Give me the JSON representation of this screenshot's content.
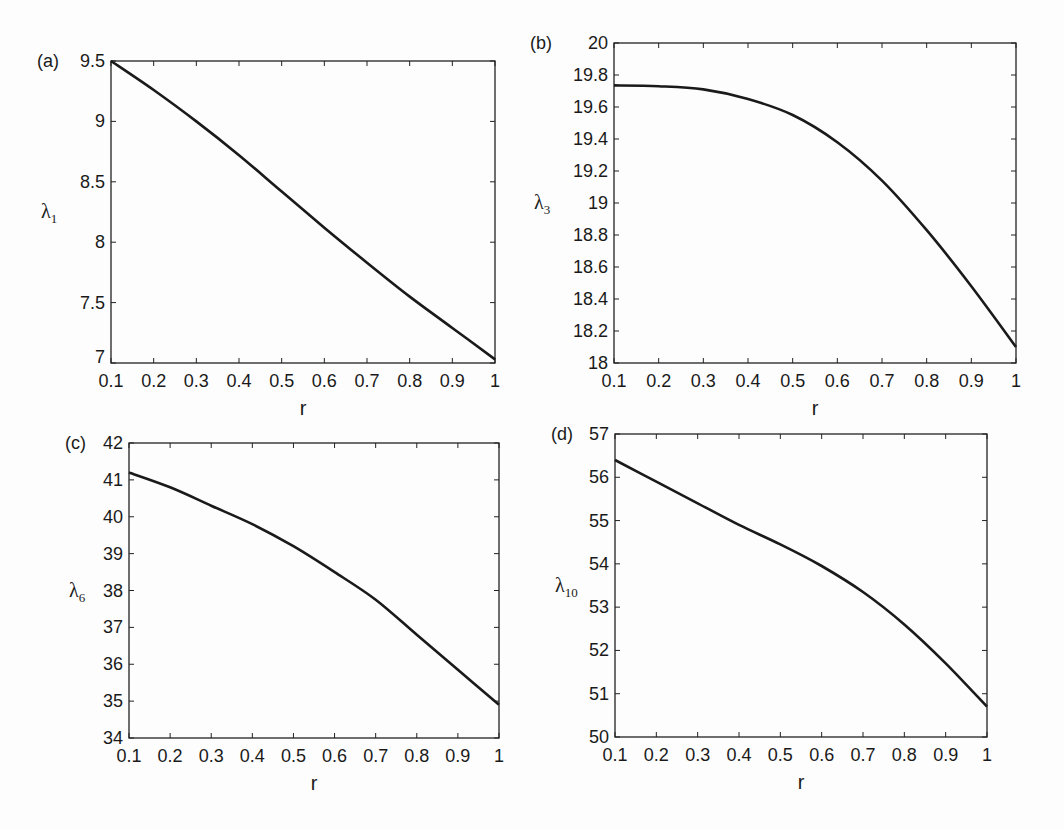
{
  "chart_data": [
    {
      "type": "line",
      "panel_label": "(a)",
      "title": "",
      "xlabel": "r",
      "ylabel": "λ",
      "ylabel_sub": "1",
      "xlim": [
        0.1,
        1
      ],
      "ylim": [
        7,
        9.5
      ],
      "xticks": [
        "0.1",
        "0.2",
        "0.3",
        "0.4",
        "0.5",
        "0.6",
        "0.7",
        "0.8",
        "0.9",
        "1"
      ],
      "yticks": [
        "7",
        "7.5",
        "8",
        "8.5",
        "9",
        "9.5"
      ],
      "grid": false,
      "x": [
        0.1,
        0.2,
        0.3,
        0.4,
        0.5,
        0.6,
        0.7,
        0.8,
        0.9,
        1.0
      ],
      "series": [
        {
          "name": "λ1",
          "values": [
            9.5,
            9.26,
            9.0,
            8.72,
            8.42,
            8.12,
            7.83,
            7.55,
            7.29,
            7.03
          ]
        }
      ],
      "box": {
        "left": 111,
        "top": 61,
        "right": 495,
        "bottom": 363
      }
    },
    {
      "type": "line",
      "panel_label": "(b)",
      "title": "",
      "xlabel": "r",
      "ylabel": "λ",
      "ylabel_sub": "3",
      "xlim": [
        0.1,
        1
      ],
      "ylim": [
        18,
        20
      ],
      "xticks": [
        "0.1",
        "0.2",
        "0.3",
        "0.4",
        "0.5",
        "0.6",
        "0.7",
        "0.8",
        "0.9",
        "1"
      ],
      "yticks": [
        "18",
        "18.2",
        "18.4",
        "18.6",
        "18.8",
        "19",
        "19.2",
        "19.4",
        "19.6",
        "19.8",
        "20"
      ],
      "grid": false,
      "x": [
        0.1,
        0.2,
        0.3,
        0.4,
        0.5,
        0.6,
        0.7,
        0.8,
        0.9,
        1.0
      ],
      "series": [
        {
          "name": "λ3",
          "values": [
            19.735,
            19.73,
            19.71,
            19.65,
            19.55,
            19.38,
            19.14,
            18.83,
            18.48,
            18.1
          ]
        }
      ],
      "box": {
        "left": 614,
        "top": 43,
        "right": 1016,
        "bottom": 363
      }
    },
    {
      "type": "line",
      "panel_label": "(c)",
      "title": "",
      "xlabel": "r",
      "ylabel": "λ",
      "ylabel_sub": "6",
      "xlim": [
        0.1,
        1
      ],
      "ylim": [
        34,
        42
      ],
      "xticks": [
        "0.1",
        "0.2",
        "0.3",
        "0.4",
        "0.5",
        "0.6",
        "0.7",
        "0.8",
        "0.9",
        "1"
      ],
      "yticks": [
        "34",
        "35",
        "36",
        "37",
        "38",
        "39",
        "40",
        "41",
        "42"
      ],
      "grid": false,
      "x": [
        0.1,
        0.2,
        0.3,
        0.4,
        0.5,
        0.6,
        0.7,
        0.8,
        0.9,
        1.0
      ],
      "series": [
        {
          "name": "λ6",
          "values": [
            41.2,
            40.8,
            40.3,
            39.8,
            39.2,
            38.5,
            37.75,
            36.8,
            35.85,
            34.9
          ]
        }
      ],
      "box": {
        "left": 129,
        "top": 443,
        "right": 499,
        "bottom": 738
      }
    },
    {
      "type": "line",
      "panel_label": "(d)",
      "title": "",
      "xlabel": "r",
      "ylabel": "λ",
      "ylabel_sub": "10",
      "xlim": [
        0.1,
        1
      ],
      "ylim": [
        50,
        57
      ],
      "xticks": [
        "0.1",
        "0.2",
        "0.3",
        "0.4",
        "0.5",
        "0.6",
        "0.7",
        "0.8",
        "0.9",
        "1"
      ],
      "yticks": [
        "50",
        "51",
        "52",
        "53",
        "54",
        "55",
        "56",
        "57"
      ],
      "grid": false,
      "x": [
        0.1,
        0.2,
        0.3,
        0.4,
        0.5,
        0.6,
        0.7,
        0.8,
        0.9,
        1.0
      ],
      "series": [
        {
          "name": "λ10",
          "values": [
            56.4,
            55.9,
            55.4,
            54.9,
            54.45,
            53.95,
            53.35,
            52.6,
            51.7,
            50.7
          ]
        }
      ],
      "box": {
        "left": 615,
        "top": 434,
        "right": 987,
        "bottom": 737
      }
    }
  ],
  "style": {
    "line_color": "#1a1a1a",
    "axis_color": "#222222",
    "background": "#fdfdfd"
  }
}
